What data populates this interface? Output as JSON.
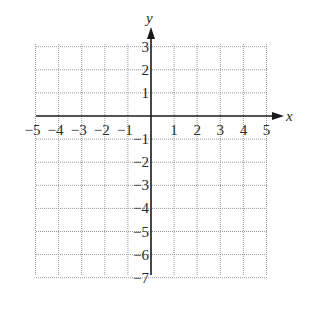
{
  "diagram": {
    "type": "coordinate-plane",
    "x_axis": {
      "name": "x",
      "min": -5,
      "max": 5,
      "tick_labels": [
        "−5",
        "−4",
        "−3",
        "−2",
        "−1",
        "1",
        "2",
        "3",
        "4",
        "5"
      ],
      "tick_values": [
        -5,
        -4,
        -3,
        -2,
        -1,
        1,
        2,
        3,
        4,
        5
      ]
    },
    "y_axis": {
      "name": "y",
      "min": -7,
      "max": 3,
      "tick_labels": [
        "3",
        "2",
        "1",
        "−1",
        "−2",
        "−3",
        "−4",
        "−5",
        "−6",
        "−7"
      ],
      "tick_values": [
        3,
        2,
        1,
        -1,
        -2,
        -3,
        -4,
        -5,
        -6,
        -7
      ]
    },
    "grid": {
      "style": "dotted",
      "step": 1,
      "color": "#9a9a9a"
    },
    "axis_color": "#1a1a1a"
  }
}
